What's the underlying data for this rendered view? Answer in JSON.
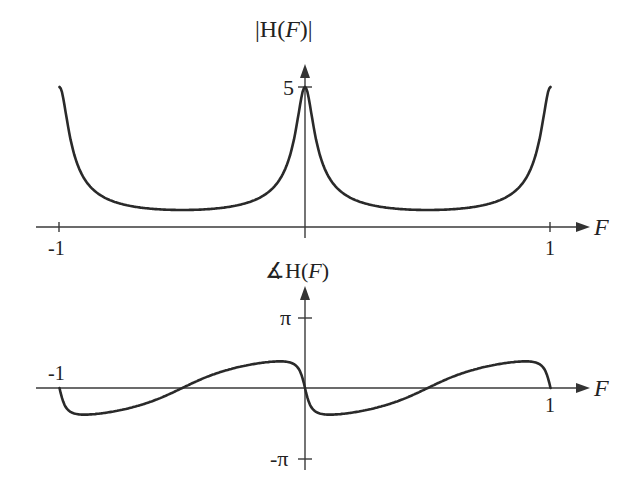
{
  "chart_data": [
    {
      "type": "line",
      "title": "|H(F)|",
      "xlabel": "F",
      "ylabel": "|H(F)|",
      "x_ticks": [
        "-1",
        "1"
      ],
      "y_ticks": [
        "5"
      ],
      "xlim": [
        -1,
        1
      ],
      "ylim": [
        0,
        5
      ],
      "grid": false,
      "legend": "none",
      "x": [
        -1,
        -0.95,
        -0.9,
        -0.8,
        -0.7,
        -0.6,
        -0.5,
        -0.4,
        -0.3,
        -0.2,
        -0.1,
        -0.05,
        0,
        0.05,
        0.1,
        0.2,
        0.3,
        0.4,
        0.5,
        0.6,
        0.7,
        0.8,
        0.9,
        0.95,
        1
      ],
      "values": [
        5,
        2.9,
        1.9,
        1.0,
        0.72,
        0.6,
        0.56,
        0.6,
        0.72,
        1.0,
        1.9,
        2.9,
        5,
        2.9,
        1.9,
        1.0,
        0.72,
        0.6,
        0.56,
        0.6,
        0.72,
        1.0,
        1.9,
        2.9,
        5
      ]
    },
    {
      "type": "line",
      "title": "∡H(F)",
      "xlabel": "F",
      "ylabel": "∡H(F)",
      "x_ticks": [
        "-1",
        "1"
      ],
      "y_ticks": [
        "π",
        "-π"
      ],
      "xlim": [
        -1,
        1
      ],
      "ylim": [
        -3.14159,
        3.14159
      ],
      "grid": false,
      "legend": "none",
      "x": [
        -1,
        -0.95,
        -0.9,
        -0.8,
        -0.7,
        -0.6,
        -0.5,
        -0.4,
        -0.3,
        -0.2,
        -0.1,
        -0.05,
        0,
        0.05,
        0.1,
        0.2,
        0.3,
        0.4,
        0.5,
        0.6,
        0.7,
        0.8,
        0.9,
        0.95,
        1
      ],
      "values": [
        0,
        -1.5,
        -1.78,
        -1.5,
        -1.0,
        -0.5,
        0,
        0.5,
        1.0,
        1.5,
        1.78,
        1.5,
        0,
        -1.5,
        -1.78,
        -1.5,
        -1.0,
        -0.5,
        0,
        0.5,
        1.0,
        1.5,
        1.78,
        1.5,
        0
      ]
    }
  ],
  "labels": {
    "top_ylabel": "|H(F)|",
    "top_xlabel": "F",
    "top_ytick": "5",
    "top_xtick_neg": "-1",
    "top_xtick_pos": "1",
    "bottom_ylabel_sym": "∡",
    "bottom_ylabel_text": "H(",
    "bottom_ylabel_var": "F",
    "bottom_ylabel_close": ")",
    "bottom_xlabel": "F",
    "bottom_ytick_pos": "π",
    "bottom_ytick_neg": "-π",
    "bottom_xtick_neg": "-1",
    "bottom_xtick_pos": "1"
  },
  "colors": {
    "curve": "#2a2a2a",
    "axis": "#3a3a3a",
    "background": "#ffffff"
  }
}
